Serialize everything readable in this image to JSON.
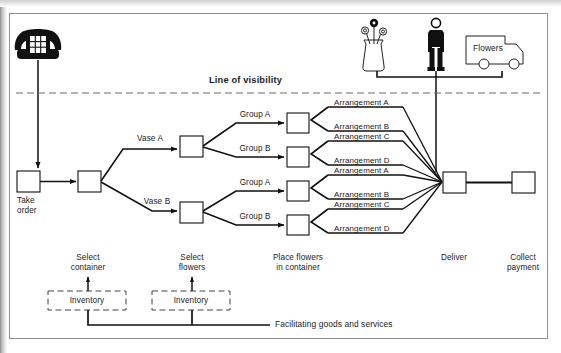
{
  "diagram": {
    "line_of_visibility": "Line of visibility",
    "facilitating": "Facilitating goods and services",
    "truck_label": "Flowers",
    "icons": {
      "telephone": "telephone-icon",
      "vase_with_flowers": "vase-with-flowers-icon",
      "person": "person-icon",
      "delivery_truck": "delivery-truck-icon"
    },
    "process_steps": [
      {
        "id": "take-order",
        "label": "Take\norder"
      },
      {
        "id": "select-container",
        "label": "Select\ncontainer"
      },
      {
        "id": "select-flowers",
        "label": "Select\nflowers"
      },
      {
        "id": "place-flowers",
        "label": "Place flowers\nin container"
      },
      {
        "id": "deliver",
        "label": "Deliver"
      },
      {
        "id": "collect-payment",
        "label": "Collect\npayment"
      }
    ],
    "vase_branches": [
      {
        "id": "vase-a",
        "label": "Vase A"
      },
      {
        "id": "vase-b",
        "label": "Vase B"
      }
    ],
    "group_branches": [
      {
        "id": "group-a-top",
        "label": "Group A"
      },
      {
        "id": "group-b-top",
        "label": "Group B"
      },
      {
        "id": "group-a-bottom",
        "label": "Group A"
      },
      {
        "id": "group-b-bottom",
        "label": "Group B"
      }
    ],
    "arrangements": [
      {
        "id": "arrangement-a-1",
        "label": "Arrangement A"
      },
      {
        "id": "arrangement-b-1",
        "label": "Arrangement B"
      },
      {
        "id": "arrangement-c-1",
        "label": "Arrangement C"
      },
      {
        "id": "arrangement-d-1",
        "label": "Arrangement D"
      },
      {
        "id": "arrangement-a-2",
        "label": "Arrangement A"
      },
      {
        "id": "arrangement-b-2",
        "label": "Arrangement B"
      },
      {
        "id": "arrangement-c-2",
        "label": "Arrangement C"
      },
      {
        "id": "arrangement-d-2",
        "label": "Arrangement D"
      }
    ],
    "inventories": [
      {
        "id": "inventory-container",
        "label": "Inventory"
      },
      {
        "id": "inventory-flowers",
        "label": "Inventory"
      }
    ],
    "colors": {
      "ink": "#1b1b1b",
      "frame": "#8e8e8e",
      "paper": "#ffffff",
      "dashed": "#666666"
    }
  }
}
